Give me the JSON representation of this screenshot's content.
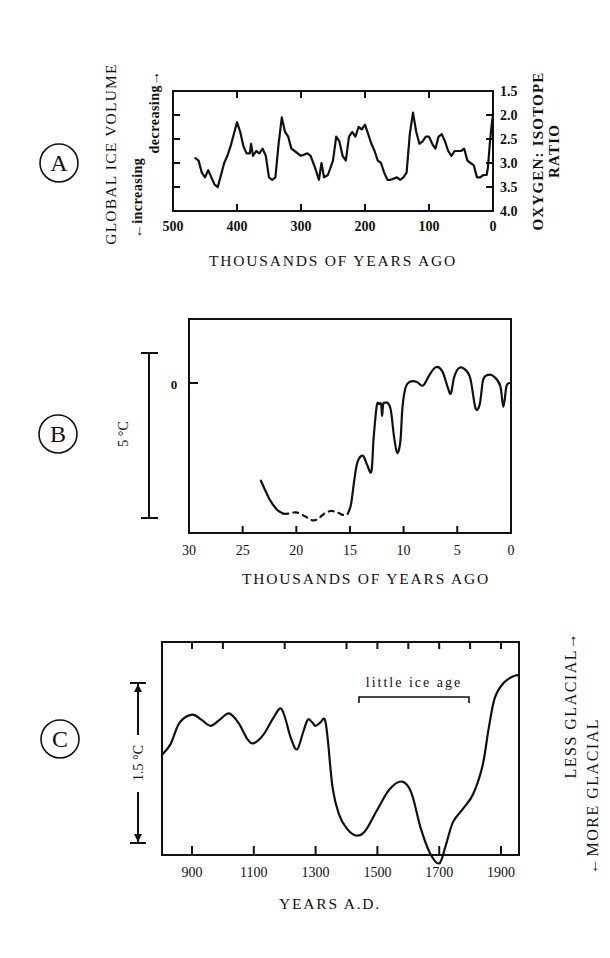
{
  "panels": {
    "A": {
      "letter": "A",
      "left_label": "GLOBAL ICE VOLUME",
      "increasing_label": "←increasing",
      "decreasing_label": "decreasing→",
      "right_label_1": "OXYGEN: ISOTOPE",
      "right_label_2": "RATIO",
      "xlabel": "THOUSANDS OF YEARS AGO",
      "x_ticks": [
        "500",
        "400",
        "300",
        "200",
        "100",
        "0"
      ],
      "y_ticks": [
        "1.5",
        "2.0",
        "2.5",
        "3.0",
        "3.5",
        "4.0"
      ]
    },
    "B": {
      "letter": "B",
      "scale_label": "5 °C",
      "zero_label": "0",
      "xlabel": "THOUSANDS OF YEARS AGO",
      "x_ticks": [
        "30",
        "25",
        "20",
        "15",
        "10",
        "5",
        "0"
      ]
    },
    "C": {
      "letter": "C",
      "scale_label": "1.5 °C",
      "annotation": "little ice age",
      "right_label_less": "LESS GLACIAL→",
      "right_label_more": "←MORE GLACIAL",
      "xlabel": "YEARS A.D.",
      "x_ticks": [
        "900",
        "1100",
        "1300",
        "1500",
        "1700",
        "1900"
      ]
    }
  },
  "chart_data": [
    {
      "type": "line",
      "panel": "A",
      "title": "Global ice volume (oxygen isotope ratio)",
      "xlabel": "THOUSANDS OF YEARS AGO",
      "ylabel": "OXYGEN: ISOTOPE RATIO",
      "left_axis_label": "GLOBAL ICE VOLUME (←increasing / decreasing→)",
      "xlim": [
        500,
        0
      ],
      "ylim": [
        4.0,
        1.5
      ],
      "y_inverted": true,
      "x": [
        465,
        460,
        455,
        450,
        445,
        440,
        435,
        430,
        425,
        420,
        415,
        410,
        405,
        400,
        395,
        390,
        385,
        380,
        378,
        375,
        370,
        365,
        360,
        355,
        350,
        345,
        340,
        335,
        330,
        325,
        320,
        315,
        310,
        300,
        290,
        285,
        278,
        272,
        268,
        264,
        258,
        250,
        245,
        240,
        235,
        230,
        225,
        220,
        215,
        210,
        205,
        200,
        195,
        190,
        185,
        180,
        175,
        170,
        165,
        160,
        150,
        145,
        140,
        135,
        130,
        125,
        120,
        115,
        110,
        105,
        100,
        95,
        90,
        85,
        80,
        75,
        70,
        65,
        60,
        50,
        45,
        40,
        35,
        30,
        25,
        20,
        15,
        10,
        8,
        5,
        2,
        0
      ],
      "values": [
        2.9,
        2.95,
        3.2,
        3.3,
        3.15,
        3.3,
        3.45,
        3.5,
        3.25,
        3.0,
        2.85,
        2.65,
        2.4,
        2.15,
        2.35,
        2.65,
        2.8,
        2.8,
        2.6,
        2.85,
        2.75,
        2.8,
        2.7,
        2.85,
        3.3,
        3.35,
        3.3,
        2.6,
        2.05,
        2.35,
        2.45,
        2.7,
        2.75,
        2.85,
        2.8,
        2.85,
        3.1,
        3.35,
        3.0,
        3.3,
        3.25,
        2.95,
        2.45,
        2.55,
        2.85,
        2.95,
        2.45,
        2.35,
        2.45,
        2.25,
        2.3,
        2.2,
        2.4,
        2.6,
        2.75,
        2.95,
        3.0,
        3.2,
        3.35,
        3.35,
        3.3,
        3.35,
        3.3,
        3.2,
        2.4,
        1.95,
        2.35,
        2.6,
        2.55,
        2.45,
        2.45,
        2.6,
        2.7,
        2.45,
        2.4,
        2.55,
        2.75,
        2.85,
        2.75,
        2.75,
        2.7,
        2.95,
        3.0,
        3.05,
        3.3,
        3.3,
        3.25,
        3.25,
        3.1,
        2.6,
        2.2,
        2.0
      ]
    },
    {
      "type": "line",
      "panel": "B",
      "title": "Temperature, last 30,000 years",
      "xlabel": "THOUSANDS OF YEARS AGO",
      "ylabel": "°C relative to present (scale bar = 5 °C)",
      "xlim": [
        30,
        0
      ],
      "y_zero_label": "0",
      "scale_bar_degC": 5,
      "x": [
        23.3,
        22.5,
        21.8,
        21.2,
        20.8,
        20.0,
        19.2,
        18.5,
        18.0,
        17.4,
        16.8,
        16.2,
        15.6,
        15.2,
        14.9,
        14.6,
        14.3,
        13.8,
        13.4,
        13.0,
        12.8,
        12.5,
        12.3,
        12.1,
        12.0,
        11.9,
        11.7,
        11.5,
        11.2,
        10.9,
        10.6,
        10.3,
        10.1,
        9.8,
        9.4,
        8.8,
        8.2,
        7.6,
        7.0,
        6.4,
        5.9,
        5.6,
        5.3,
        4.9,
        4.4,
        3.8,
        3.3,
        2.9,
        2.6,
        2.2,
        1.6,
        1.0,
        0.7,
        0.4,
        0.0
      ],
      "values": [
        -7.4,
        -8.8,
        -9.6,
        -9.9,
        -9.9,
        -9.8,
        -10.1,
        -10.4,
        -10.3,
        -9.9,
        -9.7,
        -9.8,
        -10.0,
        -9.9,
        -9.2,
        -7.4,
        -6.0,
        -5.5,
        -6.2,
        -6.7,
        -4.2,
        -1.7,
        -1.6,
        -1.6,
        -2.5,
        -1.6,
        -1.5,
        -1.5,
        -2.0,
        -4.0,
        -5.3,
        -4.4,
        -1.8,
        -0.3,
        0.1,
        0.1,
        -0.2,
        0.6,
        1.2,
        0.9,
        -0.3,
        -0.8,
        0.4,
        1.1,
        1.1,
        0.4,
        -1.9,
        -1.6,
        0.2,
        0.6,
        0.5,
        -0.2,
        -1.8,
        -0.2,
        0.0
      ]
    },
    {
      "type": "line",
      "panel": "C",
      "title": "Temperature, last 1,100 years",
      "xlabel": "YEARS A.D.",
      "ylabel": "°C (scale bar = 1.5 °C); LESS GLACIAL up, MORE GLACIAL down",
      "xlim": [
        803,
        1958
      ],
      "scale_bar_degC": 1.5,
      "annotations": [
        {
          "text": "little ice age",
          "x_start": 1450,
          "x_end": 1805
        }
      ],
      "x": [
        803,
        830,
        860,
        900,
        930,
        960,
        990,
        1020,
        1050,
        1080,
        1100,
        1130,
        1160,
        1185,
        1200,
        1220,
        1240,
        1260,
        1275,
        1290,
        1300,
        1315,
        1330,
        1340,
        1355,
        1375,
        1400,
        1430,
        1460,
        1500,
        1540,
        1580,
        1610,
        1640,
        1670,
        1700,
        1720,
        1745,
        1780,
        1810,
        1840,
        1860,
        1880,
        1910,
        1940,
        1958
      ],
      "values": [
        0.13,
        0.3,
        0.65,
        0.78,
        0.7,
        0.6,
        0.7,
        0.8,
        0.65,
        0.38,
        0.32,
        0.45,
        0.7,
        0.88,
        0.75,
        0.4,
        0.22,
        0.5,
        0.7,
        0.65,
        0.6,
        0.65,
        0.7,
        0.35,
        -0.4,
        -0.82,
        -1.05,
        -1.17,
        -1.1,
        -0.75,
        -0.42,
        -0.3,
        -0.48,
        -1.05,
        -1.45,
        -1.62,
        -1.35,
        -0.95,
        -0.72,
        -0.5,
        -0.05,
        0.55,
        1.05,
        1.3,
        1.4,
        1.42
      ]
    }
  ]
}
